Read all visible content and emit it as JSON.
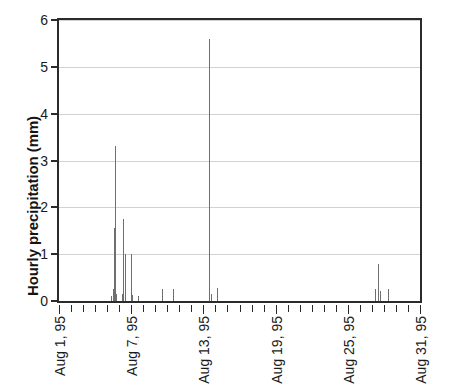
{
  "chart_data": {
    "type": "bar",
    "title": "",
    "subtitle": "",
    "xlabel": "",
    "ylabel": "Hourly precipitation (mm)",
    "ylim": [
      0,
      6
    ],
    "yticks": [
      0,
      1,
      2,
      3,
      4,
      5,
      6
    ],
    "ytick_labels": [
      "0",
      "1",
      "2",
      "3",
      "4",
      "5",
      "6"
    ],
    "xlim": [
      "Aug 1, 95",
      "Aug 31, 95"
    ],
    "xtick_labels": [
      "Aug 1, 95",
      "Aug 7, 95",
      "Aug 13, 95",
      "Aug 19, 95",
      "Aug 25, 95",
      "Aug 31, 95"
    ],
    "xtick_days": [
      1,
      7,
      13,
      19,
      25,
      31
    ],
    "x_minor_ticks_per_day": 1,
    "x_total_days": 31,
    "grid": true,
    "grid_axis": "y",
    "grid_color": "#d2d2d2",
    "bar_color": "#6f6f6f",
    "axis_color": "#2b2b2b",
    "legend": null,
    "legend_position": "none",
    "series": [
      {
        "name": "Hourly precipitation",
        "unit": "mm",
        "points": [
          {
            "day": 5.35,
            "value": 0.1
          },
          {
            "day": 5.45,
            "value": 0.25
          },
          {
            "day": 5.55,
            "value": 1.55
          },
          {
            "day": 5.65,
            "value": 3.3
          },
          {
            "day": 5.75,
            "value": 0.15
          },
          {
            "day": 6.2,
            "value": 0.15
          },
          {
            "day": 6.3,
            "value": 1.75
          },
          {
            "day": 6.45,
            "value": 1.0
          },
          {
            "day": 6.95,
            "value": 1.0
          },
          {
            "day": 7.1,
            "value": 0.12
          },
          {
            "day": 7.6,
            "value": 0.1
          },
          {
            "day": 9.6,
            "value": 0.25
          },
          {
            "day": 10.5,
            "value": 0.25
          },
          {
            "day": 13.5,
            "value": 5.6
          },
          {
            "day": 13.6,
            "value": 0.15
          },
          {
            "day": 14.1,
            "value": 0.28
          },
          {
            "day": 27.3,
            "value": 0.25
          },
          {
            "day": 27.5,
            "value": 0.78
          },
          {
            "day": 27.65,
            "value": 0.22
          },
          {
            "day": 28.3,
            "value": 0.25
          }
        ]
      }
    ]
  },
  "axes": {
    "y_axis_title": "Hourly precipitation (mm)"
  }
}
